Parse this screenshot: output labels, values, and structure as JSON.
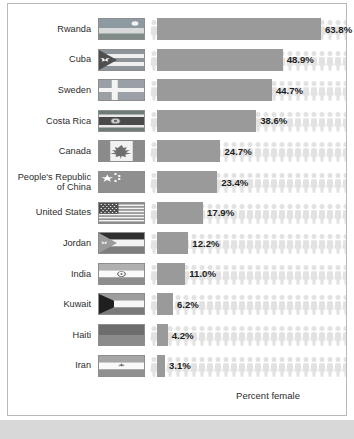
{
  "chart_data": {
    "type": "bar",
    "title": "",
    "xlabel": "Percent female",
    "ylabel": "",
    "xlim": [
      0,
      100
    ],
    "grid": false,
    "legend": "none",
    "orientation": "horizontal",
    "value_suffix": "%",
    "categories": [
      "Rwanda",
      "Cuba",
      "Sweden",
      "Costa Rica",
      "Canada",
      "People's Republic\nof China",
      "United States",
      "Jordan",
      "India",
      "Kuwait",
      "Haiti",
      "Iran"
    ],
    "values": [
      63.8,
      48.9,
      44.7,
      38.6,
      24.7,
      23.4,
      17.9,
      12.2,
      11.0,
      6.2,
      4.2,
      3.1
    ],
    "value_labels": [
      "63.8%",
      "48.9%",
      "44.7%",
      "38.6%",
      "24.7%",
      "23.4%",
      "17.9%",
      "12.2%",
      "11.0%",
      "6.2%",
      "4.2%",
      "3.1%"
    ],
    "bar_color": "#9a9a9a",
    "pictogram_color": "#e2e2e2",
    "pictogram_name": "person-icon"
  },
  "rows": [
    {
      "country": "Rwanda",
      "value_label": "63.8%",
      "flag": "flag-rwanda"
    },
    {
      "country": "Cuba",
      "value_label": "48.9%",
      "flag": "flag-cuba"
    },
    {
      "country": "Sweden",
      "value_label": "44.7%",
      "flag": "flag-sweden"
    },
    {
      "country": "Costa Rica",
      "value_label": "38.6%",
      "flag": "flag-costa-rica"
    },
    {
      "country": "Canada",
      "value_label": "24.7%",
      "flag": "flag-canada"
    },
    {
      "country": "People's Republic\nof China",
      "value_label": "23.4%",
      "flag": "flag-china"
    },
    {
      "country": "United States",
      "value_label": "17.9%",
      "flag": "flag-united-states"
    },
    {
      "country": "Jordan",
      "value_label": "12.2%",
      "flag": "flag-jordan"
    },
    {
      "country": "India",
      "value_label": "11.0%",
      "flag": "flag-india"
    },
    {
      "country": "Kuwait",
      "value_label": "6.2%",
      "flag": "flag-kuwait"
    },
    {
      "country": "Haiti",
      "value_label": "4.2%",
      "flag": "flag-haiti"
    },
    {
      "country": "Iran",
      "value_label": "3.1%",
      "flag": "flag-iran"
    }
  ],
  "axis": {
    "label": "Percent female"
  },
  "colors": {
    "bar": "#9a9a9a",
    "pictogram": "#e2e2e2",
    "border": "#b9b9b9",
    "text": "#2b2b2b",
    "value_text": "#1d1d1d",
    "background": "#ffffff",
    "bottom_strip": "#d8d8d8"
  }
}
